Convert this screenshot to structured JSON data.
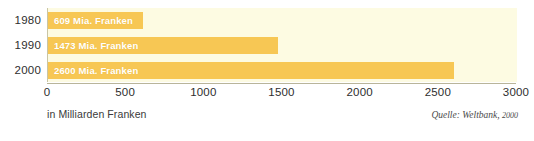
{
  "chart_data": {
    "type": "bar",
    "orientation": "horizontal",
    "title": "",
    "subtitle": "",
    "categories": [
      "1980",
      "1990",
      "2000"
    ],
    "values": [
      609,
      1473,
      2600
    ],
    "data_labels": [
      "609 Mia. Franken",
      "1473 Mia. Franken",
      "2600 Mia. Franken"
    ],
    "unit": "Mia. Franken",
    "xlabel": "in Milliarden Franken",
    "ylabel": "",
    "xlim": [
      0,
      3000
    ],
    "xticks": [
      0,
      500,
      1000,
      1500,
      2000,
      2500,
      3000
    ],
    "xtick_labels": [
      "0",
      "500",
      "1000",
      "1500",
      "2000",
      "2500",
      "3000"
    ],
    "grid": false,
    "legend": "none",
    "series": [
      {
        "name": "Weltbank",
        "values": [
          609,
          1473,
          2600
        ]
      }
    ],
    "annotations": {
      "source_prefix": "Quelle: Weltbank,",
      "source_year": "2000",
      "source_full": "Quelle: Weltbank, 2000"
    },
    "colors": {
      "bar": "#f7c754",
      "plot_background": "#fdfbe2",
      "axis": "#b9b59a",
      "label_text": "#ffffff",
      "tick_text": "#2e2e2e",
      "page_background": "#ffffff"
    }
  }
}
